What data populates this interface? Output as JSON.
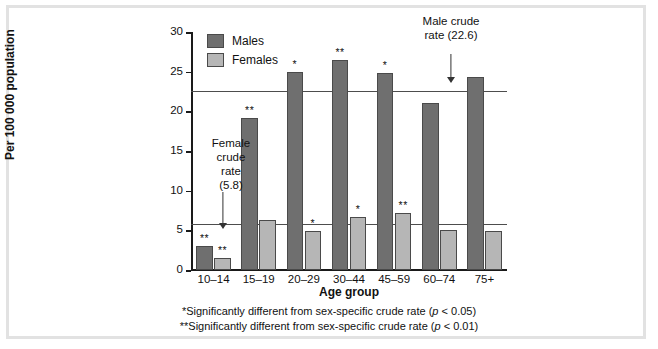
{
  "chart_data": {
    "type": "bar",
    "title": "",
    "xlabel": "Age group",
    "ylabel": "Per 100 000 population",
    "ylim": [
      0,
      30
    ],
    "yticks": [
      0,
      5,
      10,
      15,
      20,
      25,
      30
    ],
    "grid": false,
    "legend_position": "top-left",
    "categories": [
      "10–14",
      "15–19",
      "20–29",
      "30–44",
      "45–59",
      "60–74",
      "75+"
    ],
    "series": [
      {
        "name": "Males",
        "color": "#6f6f6f",
        "values": [
          3.0,
          19.1,
          25.0,
          26.5,
          24.8,
          21.1,
          24.3
        ],
        "significance": [
          "**",
          "**",
          "*",
          "**",
          "*",
          "",
          ""
        ]
      },
      {
        "name": "Females",
        "color": "#b6b6b6",
        "values": [
          1.5,
          6.3,
          4.9,
          6.7,
          7.2,
          5.0,
          4.9
        ],
        "significance": [
          "**",
          "",
          "*",
          "*",
          "**",
          "",
          ""
        ]
      }
    ],
    "reference_lines": [
      {
        "name": "Male crude rate",
        "value": 22.6,
        "label": "Male crude rate (22.6)"
      },
      {
        "name": "Female crude rate",
        "value": 5.8,
        "label": "Female crude rate (5.8)"
      }
    ],
    "annotations": [
      {
        "name": "male-crude-rate",
        "line1": "Male crude",
        "line2": "rate (22.6)"
      },
      {
        "name": "female-crude-rate",
        "line1": "Female",
        "line2": "crude",
        "line3": "rate",
        "line4": "(5.8)"
      }
    ]
  },
  "legend": {
    "items": [
      {
        "label": "Males",
        "color": "#6f6f6f"
      },
      {
        "label": "Females",
        "color": "#b6b6b6"
      }
    ]
  },
  "axes": {
    "y_title": "Per 100 000 population",
    "x_title": "Age group",
    "y_tick_labels": [
      "30",
      "25",
      "20",
      "15",
      "10",
      "5",
      "0"
    ],
    "x_tick_labels": [
      "10–14",
      "15–19",
      "20–29",
      "30–44",
      "45–59",
      "60–74",
      "75+"
    ]
  },
  "footnotes": {
    "one_star_pre": "*Significantly different from sex-specific crude rate (",
    "one_star_p": "p",
    "one_star_post": " < 0.05)",
    "two_star_pre": "**Significantly different from sex-specific crude rate (",
    "two_star_p": "p",
    "two_star_post": " < 0.01)"
  }
}
